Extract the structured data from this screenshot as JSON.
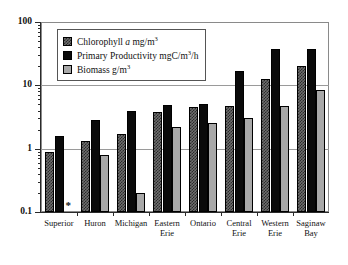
{
  "chart_data": {
    "type": "bar",
    "title": "",
    "xlabel": "",
    "ylabel": "",
    "yscale": "log",
    "ylim": [
      0.1,
      100
    ],
    "ytick_labels": [
      "0.1",
      "1",
      "10",
      "100"
    ],
    "ytick_values": [
      0.1,
      1,
      10,
      100
    ],
    "grid": true,
    "legend_position": "top-left",
    "categories": [
      "Superior",
      "Huron",
      "Michigan",
      "Eastern\nErie",
      "Ontario",
      "Central\nErie",
      "Western\nErie",
      "Saginaw\nBay"
    ],
    "series": [
      {
        "name": "Chlorophyll a mg/m3",
        "key": "chl",
        "values": [
          0.9,
          1.3,
          1.7,
          3.8,
          4.6,
          4.7,
          12.5,
          20.0
        ]
      },
      {
        "name": "Primary Productivity mgC/m3/h",
        "key": "pp",
        "values": [
          1.6,
          2.8,
          4.0,
          4.9,
          5.0,
          17.0,
          37.0,
          37.0
        ]
      },
      {
        "name": "Biomass g/m3",
        "key": "bio",
        "values": [
          null,
          0.8,
          0.2,
          2.2,
          2.5,
          3.0,
          4.8,
          8.5
        ]
      }
    ],
    "annotations": [
      {
        "name": "missing-biomass-marker",
        "symbol": "*",
        "category": "Superior",
        "series": "Biomass g/m3"
      }
    ]
  },
  "legend": {
    "items": [
      {
        "key": "chl",
        "prefix": "Chlorophyll ",
        "italic": "a",
        "suffix": " mg/m",
        "sup": "3"
      },
      {
        "key": "pp",
        "prefix": "Primary Productivity mgC/m",
        "italic": "",
        "suffix": "",
        "sup": "3",
        "tail": "/h"
      },
      {
        "key": "bio",
        "prefix": "Biomass g/m",
        "italic": "",
        "suffix": "",
        "sup": "3"
      }
    ],
    "text": {
      "chl_pre": "Chlorophyll ",
      "chl_italic": "a",
      "chl_unit": " mg/m",
      "chl_sup": "3",
      "pp_pre": "Primary Productivity mgC/m",
      "pp_sup": "3",
      "pp_tail": "/h",
      "bio_pre": "Biomass g/m",
      "bio_sup": "3"
    }
  },
  "axis": {
    "y_labels": [
      "100",
      "10",
      "1",
      "0.1"
    ],
    "x_labels": [
      "Superior",
      "Huron",
      "Michigan",
      "Eastern\nErie",
      "Ontario",
      "Central\nErie",
      "Western\nErie",
      "Saginaw\nBay"
    ]
  },
  "marks": {
    "asterisk": "*"
  }
}
